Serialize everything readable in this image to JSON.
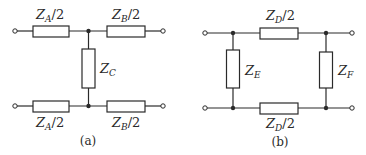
{
  "diagram": {
    "type": "two-port network equivalents",
    "colors": {
      "stroke": "#2a2a2a",
      "background": "#ffffff"
    },
    "circuit_a": {
      "caption": "(a)",
      "topology": "T-network",
      "labels": {
        "top_left": {
          "main": "Z",
          "sub": "A",
          "suffix": "/2"
        },
        "top_right": {
          "main": "Z",
          "sub": "B",
          "suffix": "/2"
        },
        "shunt": {
          "main": "Z",
          "sub": "C",
          "suffix": ""
        },
        "bottom_left": {
          "main": "Z",
          "sub": "A",
          "suffix": "/2"
        },
        "bottom_right": {
          "main": "Z",
          "sub": "B",
          "suffix": "/2"
        }
      }
    },
    "circuit_b": {
      "caption": "(b)",
      "topology": "Pi-network (balanced)",
      "labels": {
        "top_series": {
          "main": "Z",
          "sub": "D",
          "suffix": "/2"
        },
        "left_shunt": {
          "main": "Z",
          "sub": "E",
          "suffix": ""
        },
        "right_shunt": {
          "main": "Z",
          "sub": "F",
          "suffix": ""
        },
        "bottom_series": {
          "main": "Z",
          "sub": "D",
          "suffix": "/2"
        }
      }
    }
  }
}
